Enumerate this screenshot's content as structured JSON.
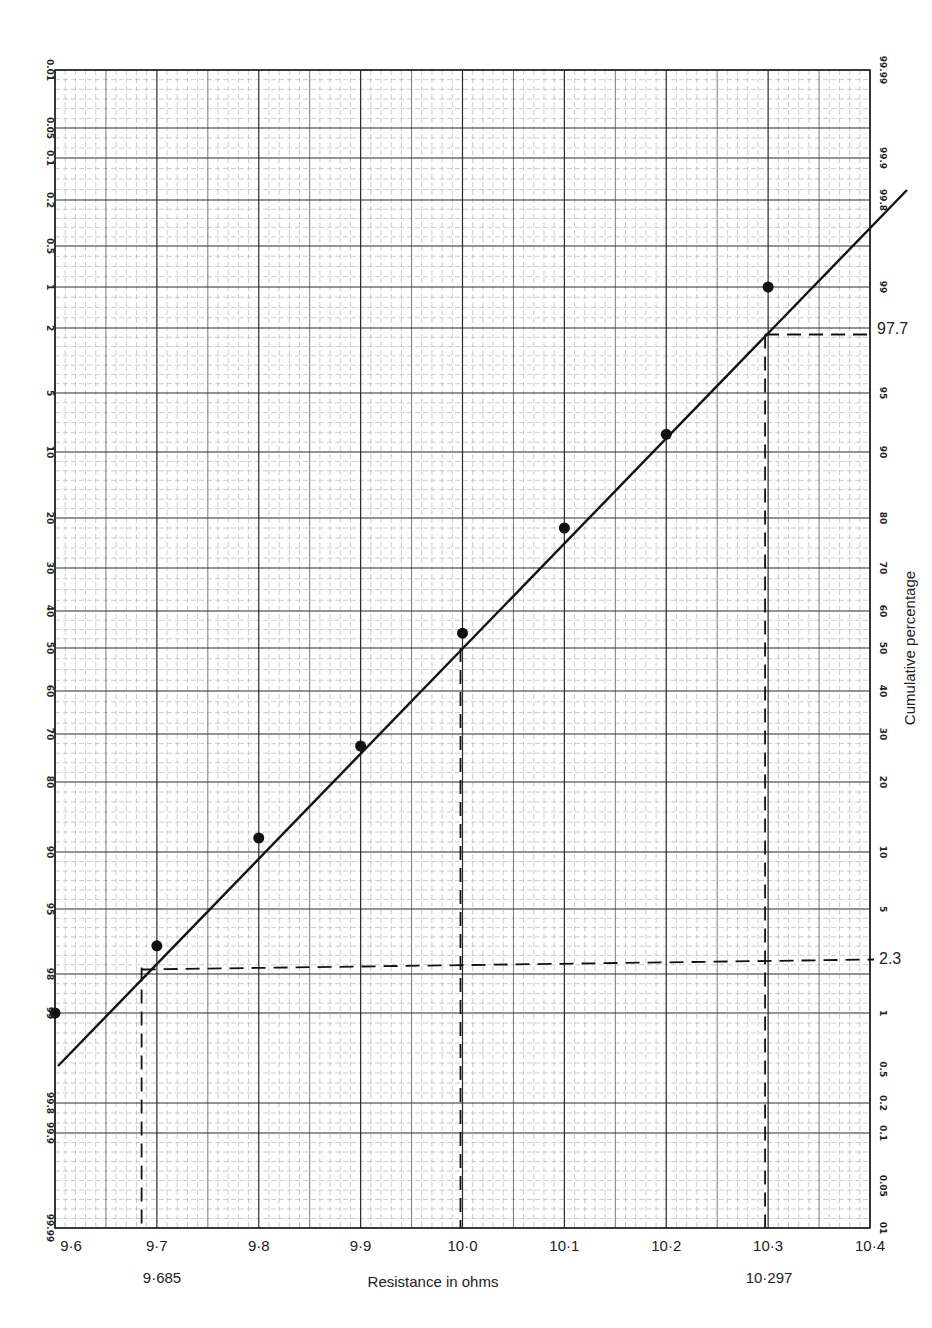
{
  "chart_data": {
    "type": "scatter",
    "subtype": "probability-paper with fitted line",
    "title": "",
    "xlabel": "Resistance in ohms",
    "ylabel_right": "Cumulative percentage",
    "xlim": [
      9.6,
      10.4
    ],
    "x_ticks": [
      "9·6",
      "9·7",
      "9·8",
      "9·9",
      "10·0",
      "10·1",
      "10·2",
      "10·3",
      "10·4"
    ],
    "x_tick_values": [
      9.6,
      9.7,
      9.8,
      9.9,
      10.0,
      10.1,
      10.2,
      10.3,
      10.4
    ],
    "left_axis_ticks": [
      "0.01",
      "0.05",
      "0.1",
      "0.2",
      "0.5",
      "1",
      "2",
      "5",
      "10",
      "20",
      "30",
      "40",
      "50",
      "60",
      "70",
      "80",
      "90",
      "95",
      "98",
      "99",
      "99.8",
      "99.9",
      "99.99"
    ],
    "right_axis_ticks": [
      "99.99",
      "99.9",
      "99.8",
      "99",
      "95",
      "90",
      "80",
      "70",
      "60",
      "50",
      "40",
      "30",
      "20",
      "10",
      "5",
      "1",
      "0.5",
      "0.2",
      "0.1",
      "0.05",
      "01"
    ],
    "grid": true,
    "series": [
      {
        "name": "Observed cumulative percentage",
        "kind": "points",
        "x": [
          9.6,
          9.7,
          9.8,
          9.9,
          10.0,
          10.1,
          10.2,
          10.3
        ],
        "cumulative_percent": [
          1,
          3.3,
          12,
          27.5,
          54,
          78,
          91.5,
          99
        ]
      },
      {
        "name": "Fitted normal line",
        "kind": "line",
        "x": [
          9.6,
          10.4
        ],
        "cumulative_percent": [
          0.6,
          99.8
        ]
      }
    ],
    "annotations": [
      {
        "text": "97.7",
        "x": 10.297,
        "cumulative_percent": 97.7,
        "style": "dashed guide"
      },
      {
        "text": "2.3",
        "x": 9.685,
        "cumulative_percent": 2.3,
        "style": "dashed guide"
      },
      {
        "text": "50",
        "x": 10.0,
        "cumulative_percent": 50,
        "style": "dashed guide"
      },
      {
        "text": "9·685",
        "x": 9.685
      },
      {
        "text": "10·297",
        "x": 10.297
      }
    ]
  },
  "labels": {
    "xlabel": "Resistance in ohms",
    "ylabel_right": "Cumulative percentage",
    "annot_977": "97.7",
    "annot_23": "2.3",
    "annot_9685": "9·685",
    "annot_10297": "10·297"
  }
}
